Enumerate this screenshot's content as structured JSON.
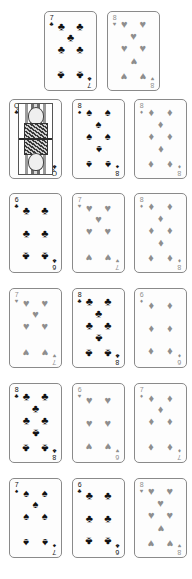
{
  "meta": {
    "layout": "playing-card-grid",
    "columns": 3,
    "rows": 6,
    "card_width": 53,
    "card_height": 80,
    "background_color": "#ffffff",
    "black_suit_color": "#111111",
    "red_suit_color": "#8e8e8e"
  },
  "suit_glyphs": {
    "clubs": "♣",
    "spades": "♠",
    "hearts": "♥",
    "diamonds": "♦"
  },
  "cards": [
    {
      "id": "card-r1c2",
      "rank": "7",
      "suit": "clubs",
      "suit_glyph": "♣",
      "color": "black",
      "label": "7 of Clubs",
      "face_card": false,
      "row": 1,
      "col": 2,
      "x": 44,
      "y": 11
    },
    {
      "id": "card-r1c3",
      "rank": "8",
      "suit": "hearts",
      "suit_glyph": "♥",
      "color": "red",
      "label": "8 of Hearts",
      "face_card": false,
      "row": 1,
      "col": 3,
      "x": 107,
      "y": 11
    },
    {
      "id": "card-r2c1",
      "rank": "Q",
      "suit": "clubs",
      "suit_glyph": "♣",
      "color": "black",
      "label": "Queen of Clubs",
      "face_card": true,
      "row": 2,
      "col": 1,
      "x": 9,
      "y": 99
    },
    {
      "id": "card-r2c2",
      "rank": "8",
      "suit": "spades",
      "suit_glyph": "♠",
      "color": "black",
      "label": "8 of Spades",
      "face_card": false,
      "row": 2,
      "col": 2,
      "x": 72,
      "y": 99
    },
    {
      "id": "card-r2c3",
      "rank": "8",
      "suit": "diamonds",
      "suit_glyph": "♦",
      "color": "red",
      "label": "8 of Diamonds",
      "face_card": false,
      "row": 2,
      "col": 3,
      "x": 134,
      "y": 99
    },
    {
      "id": "card-r3c1",
      "rank": "6",
      "suit": "clubs",
      "suit_glyph": "♣",
      "color": "black",
      "label": "6 of Clubs",
      "face_card": false,
      "row": 3,
      "col": 1,
      "x": 9,
      "y": 193
    },
    {
      "id": "card-r3c2",
      "rank": "7",
      "suit": "hearts",
      "suit_glyph": "♥",
      "color": "red",
      "label": "7 of Hearts",
      "face_card": false,
      "row": 3,
      "col": 2,
      "x": 72,
      "y": 193
    },
    {
      "id": "card-r3c3",
      "rank": "8",
      "suit": "diamonds",
      "suit_glyph": "♦",
      "color": "red",
      "label": "8 of Diamonds",
      "face_card": false,
      "row": 3,
      "col": 3,
      "x": 134,
      "y": 193
    },
    {
      "id": "card-r4c1",
      "rank": "7",
      "suit": "hearts",
      "suit_glyph": "♥",
      "color": "red",
      "label": "7 of Hearts",
      "face_card": false,
      "row": 4,
      "col": 1,
      "x": 9,
      "y": 288
    },
    {
      "id": "card-r4c2",
      "rank": "8",
      "suit": "clubs",
      "suit_glyph": "♣",
      "color": "black",
      "label": "8 of Clubs",
      "face_card": false,
      "row": 4,
      "col": 2,
      "x": 72,
      "y": 288
    },
    {
      "id": "card-r4c3",
      "rank": "6",
      "suit": "diamonds",
      "suit_glyph": "♦",
      "color": "red",
      "label": "6 of Diamonds",
      "face_card": false,
      "row": 4,
      "col": 3,
      "x": 134,
      "y": 288
    },
    {
      "id": "card-r5c1",
      "rank": "8",
      "suit": "clubs",
      "suit_glyph": "♣",
      "color": "black",
      "label": "8 of Clubs",
      "face_card": false,
      "row": 5,
      "col": 1,
      "x": 9,
      "y": 383
    },
    {
      "id": "card-r5c2",
      "rank": "6",
      "suit": "hearts",
      "suit_glyph": "♥",
      "color": "red",
      "label": "6 of Hearts",
      "face_card": false,
      "row": 5,
      "col": 2,
      "x": 72,
      "y": 383
    },
    {
      "id": "card-r5c3",
      "rank": "7",
      "suit": "diamonds",
      "suit_glyph": "♦",
      "color": "red",
      "label": "7 of Diamonds",
      "face_card": false,
      "row": 5,
      "col": 3,
      "x": 134,
      "y": 383
    },
    {
      "id": "card-r6c1",
      "rank": "7",
      "suit": "spades",
      "suit_glyph": "♠",
      "color": "black",
      "label": "7 of Spades",
      "face_card": false,
      "row": 6,
      "col": 1,
      "x": 9,
      "y": 478
    },
    {
      "id": "card-r6c2",
      "rank": "6",
      "suit": "clubs",
      "suit_glyph": "♣",
      "color": "black",
      "label": "6 of Clubs",
      "face_card": false,
      "row": 6,
      "col": 2,
      "x": 72,
      "y": 478
    },
    {
      "id": "card-r6c3",
      "rank": "8",
      "suit": "hearts",
      "suit_glyph": "♥",
      "color": "red",
      "label": "8 of Hearts",
      "face_card": false,
      "row": 6,
      "col": 3,
      "x": 134,
      "y": 478
    }
  ],
  "pip_layouts": {
    "6": [
      {
        "x": 22,
        "y": 17,
        "inverted": false
      },
      {
        "x": 78,
        "y": 17,
        "inverted": false
      },
      {
        "x": 22,
        "y": 50,
        "inverted": false
      },
      {
        "x": 78,
        "y": 50,
        "inverted": false
      },
      {
        "x": 22,
        "y": 83,
        "inverted": true
      },
      {
        "x": 78,
        "y": 83,
        "inverted": true
      }
    ],
    "7": [
      {
        "x": 22,
        "y": 14,
        "inverted": false
      },
      {
        "x": 78,
        "y": 14,
        "inverted": false
      },
      {
        "x": 50,
        "y": 30,
        "inverted": false
      },
      {
        "x": 22,
        "y": 47,
        "inverted": false
      },
      {
        "x": 78,
        "y": 47,
        "inverted": false
      },
      {
        "x": 22,
        "y": 84,
        "inverted": true
      },
      {
        "x": 78,
        "y": 84,
        "inverted": true
      }
    ],
    "8": [
      {
        "x": 22,
        "y": 12,
        "inverted": false
      },
      {
        "x": 78,
        "y": 12,
        "inverted": false
      },
      {
        "x": 50,
        "y": 29,
        "inverted": false
      },
      {
        "x": 22,
        "y": 46,
        "inverted": false
      },
      {
        "x": 78,
        "y": 46,
        "inverted": false
      },
      {
        "x": 50,
        "y": 64,
        "inverted": true
      },
      {
        "x": 22,
        "y": 86,
        "inverted": true
      },
      {
        "x": 78,
        "y": 86,
        "inverted": true
      }
    ]
  }
}
